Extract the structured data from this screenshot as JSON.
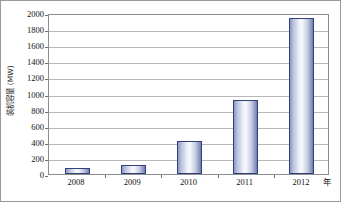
{
  "chart_data": {
    "type": "bar",
    "title": "",
    "categories": [
      "2008",
      "2009",
      "2010",
      "2011",
      "2012"
    ],
    "values": [
      75,
      115,
      415,
      915,
      1940
    ],
    "series": [
      {
        "name": "装机容量",
        "values": [
          75,
          115,
          415,
          915,
          1940
        ]
      }
    ],
    "xlabel": "年",
    "ylabel": "装机容量 (MW)",
    "ylim": [
      0,
      2000
    ],
    "ytick_labels": [
      "0",
      "200",
      "400",
      "600",
      "800",
      "1000",
      "1200",
      "1400",
      "1600",
      "1800",
      "2000"
    ],
    "ytick_values": [
      0,
      200,
      400,
      600,
      800,
      1000,
      1200,
      1400,
      1600,
      1800,
      2000
    ],
    "xtick_labels": [
      "2008",
      "2009",
      "2010",
      "2011",
      "2012"
    ],
    "grid": true,
    "grid_axis": "y",
    "legend": false,
    "legend_position": "none",
    "colors": {
      "bar_border": "#33417a",
      "bar_fill_light": "#f7f9fc",
      "bar_fill_dark": "#6d7ab0",
      "gridline": "#b9b9b9",
      "axis": "#8d8d8d",
      "text": "#131313",
      "background": "#ffffff",
      "frame": "#9a9a9a"
    }
  }
}
